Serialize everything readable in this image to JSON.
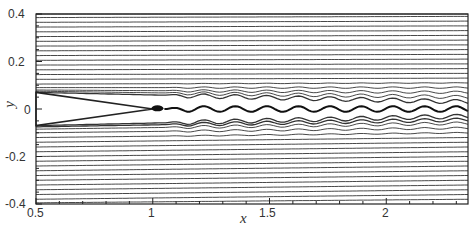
{
  "chart_data": {
    "type": "line",
    "title": "",
    "subtitle": "",
    "xlabel": "x",
    "ylabel": "y",
    "xlim": [
      0.5,
      2.35
    ],
    "ylim": [
      -0.4,
      0.4
    ],
    "x_ticks": [
      0.5,
      1,
      1.5,
      2
    ],
    "x_tick_labels": [
      "0.5",
      "1",
      "1.5",
      "2"
    ],
    "y_ticks": [
      -0.4,
      -0.2,
      0,
      0.2,
      0.4
    ],
    "y_tick_labels": [
      "-0.4",
      "-0.2",
      "0",
      "0.2",
      "0.4"
    ],
    "grid": false,
    "legend": null,
    "wedge": {
      "x_start": 0.5,
      "x_tip": 1.0,
      "half_width_at_start": 0.07,
      "center_y": 0.0
    },
    "wake": {
      "x_start": 1.05,
      "x_end": 2.35,
      "amplitude": 0.012,
      "wavelength": 0.135,
      "center_y": 0.0
    },
    "streamlines": {
      "upper_count": 20,
      "lower_count": 19,
      "upper_y_at_x_0_5": [
        0.4,
        0.385,
        0.365,
        0.345,
        0.325,
        0.305,
        0.285,
        0.265,
        0.245,
        0.225,
        0.205,
        0.185,
        0.165,
        0.145,
        0.125,
        0.105,
        0.09,
        0.08,
        0.075,
        0.07
      ],
      "lower_y_at_x_0_5": [
        -0.07,
        -0.075,
        -0.085,
        -0.1,
        -0.12,
        -0.14,
        -0.16,
        -0.18,
        -0.2,
        -0.22,
        -0.24,
        -0.26,
        -0.28,
        -0.3,
        -0.32,
        -0.34,
        -0.36,
        -0.38,
        -0.395
      ],
      "upper_y_at_x_end": [
        0.4,
        0.39,
        0.37,
        0.35,
        0.33,
        0.31,
        0.29,
        0.27,
        0.25,
        0.23,
        0.21,
        0.19,
        0.17,
        0.15,
        0.13,
        0.11,
        0.09,
        0.07,
        0.05,
        0.03
      ],
      "lower_y_at_x_end": [
        -0.03,
        -0.045,
        -0.06,
        -0.08,
        -0.1,
        -0.12,
        -0.14,
        -0.16,
        -0.18,
        -0.2,
        -0.22,
        -0.24,
        -0.26,
        -0.28,
        -0.3,
        -0.32,
        -0.34,
        -0.36,
        -0.38
      ]
    },
    "colors": {
      "lines": "#333333",
      "frame": "#222222",
      "background": "#ffffff"
    }
  },
  "axes": {
    "x_label": "x",
    "y_label": "y",
    "x_tick_labels": [
      "0.5",
      "1",
      "1.5",
      "2"
    ],
    "y_tick_labels": [
      "0.4",
      "0.2",
      "0",
      "-0.2",
      "-0.4"
    ]
  }
}
